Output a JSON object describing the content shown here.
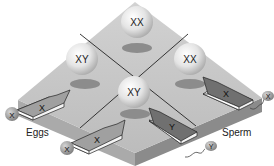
{
  "diagram": {
    "type": "punnett-square-3d",
    "cells": [
      {
        "position": "top",
        "genotype": "XX"
      },
      {
        "position": "left",
        "genotype": "XY"
      },
      {
        "position": "right",
        "genotype": "XX"
      },
      {
        "position": "bottom",
        "genotype": "XY"
      }
    ],
    "egg_arrows": [
      {
        "position": "upper-left",
        "label": "X"
      },
      {
        "position": "lower-left",
        "label": "X"
      }
    ],
    "sperm_arrows": [
      {
        "position": "upper-right",
        "label": "X"
      },
      {
        "position": "lower-right",
        "label": "Y"
      }
    ],
    "eggs": {
      "label": "Eggs",
      "cells": [
        {
          "label": "X"
        },
        {
          "label": "X"
        }
      ]
    },
    "sperm": {
      "label": "Sperm",
      "cells": [
        {
          "label": "X"
        },
        {
          "label": "Y"
        }
      ]
    },
    "colors": {
      "board_top": "#c9c9c9",
      "board_left_side": "#a9a9a9",
      "board_right_side": "#8a8a8a",
      "ball": "#e6e6e6",
      "shadow": "#8c8c8c",
      "gamete": "#9a9a9a",
      "line": "#222222"
    }
  }
}
